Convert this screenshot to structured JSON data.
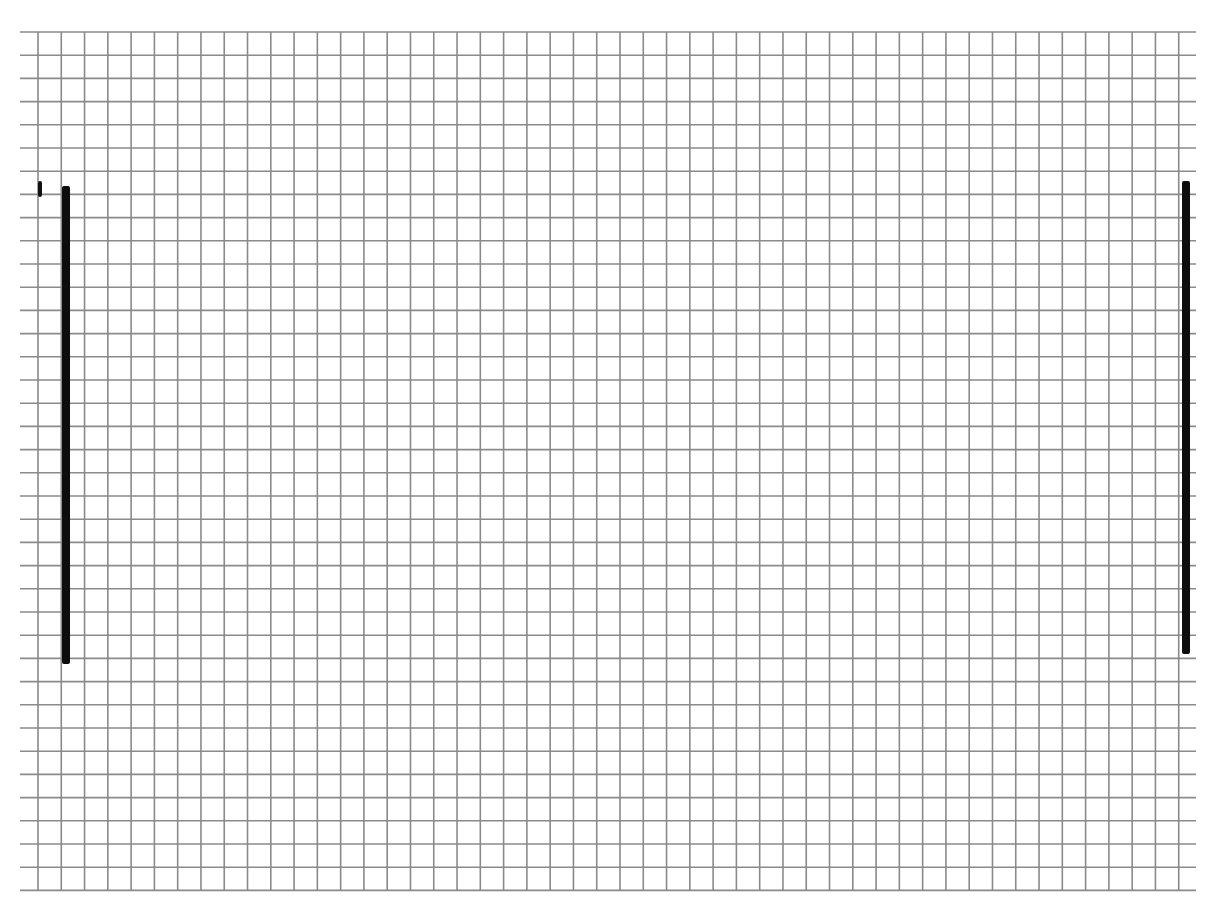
{
  "page": {
    "background": "#ffffff"
  },
  "grid": {
    "line_color": "#8a8a8a",
    "line_width": 1.6,
    "x_start": 20,
    "x_end": 1196,
    "y_start": 32,
    "y_end": 891,
    "first_vertical_x": 38,
    "vertical_pitch": 23.28,
    "vertical_count": 50,
    "first_horizontal_y": 32,
    "horizontal_pitch": 23.2,
    "horizontal_count": 38
  },
  "strokes": [
    {
      "name": "small-tick-stroke",
      "x": 38,
      "y": 181,
      "w": 4,
      "h": 16,
      "color": "#111111"
    },
    {
      "name": "left-vertical-stroke",
      "x": 62,
      "y": 186,
      "w": 8,
      "h": 478,
      "color": "#0d0d0d"
    },
    {
      "name": "right-vertical-stroke",
      "x": 1182,
      "y": 181,
      "w": 8,
      "h": 473,
      "color": "#0d0d0d"
    }
  ]
}
